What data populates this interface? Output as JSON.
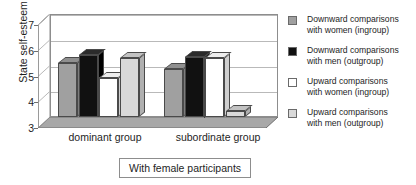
{
  "chart_data": {
    "type": "bar",
    "title": "",
    "xlabel": "",
    "ylabel": "State self-esteem",
    "ylim": [
      3,
      7
    ],
    "yticks": [
      3,
      4,
      5,
      6,
      7
    ],
    "grid": true,
    "legend_position": "right",
    "style": "3d-bar-grayscale",
    "categories": [
      "dominant group",
      "subordinate group"
    ],
    "series": [
      {
        "name": "Downward comparisons with women (ingroup)",
        "color": "#a0a0a0",
        "values": [
          5.1,
          4.85
        ]
      },
      {
        "name": "Downward comparisons with men (outgroup)",
        "color": "#111111",
        "values": [
          5.4,
          5.35
        ]
      },
      {
        "name": "Upward comparisons with women (ingroup)",
        "color": "#ffffff",
        "values": [
          4.5,
          5.3
        ]
      },
      {
        "name": "Upward comparisons with men (outgroup)",
        "color": "#d9d9d9",
        "values": [
          5.3,
          3.25
        ]
      }
    ],
    "annotations": [
      "With female participants"
    ]
  },
  "axis": {
    "y_title": "State self-esteem",
    "tick_7": "7",
    "tick_6": "6",
    "tick_5": "5",
    "tick_4": "4",
    "tick_3": "3"
  },
  "xaxis": {
    "cat_0": "dominant group",
    "cat_1": "subordinate group"
  },
  "legend": {
    "items": [
      {
        "line1": "Downward comparisons",
        "line2": "with women (ingroup)"
      },
      {
        "line1": "Downward comparisons",
        "line2": "with men (outgroup)"
      },
      {
        "line1": "Upward comparisons",
        "line2": "with women (ingroup)"
      },
      {
        "line1": "Upward comparisons",
        "line2": "with men (outgroup)"
      }
    ]
  },
  "caption": {
    "text": "With female participants"
  }
}
